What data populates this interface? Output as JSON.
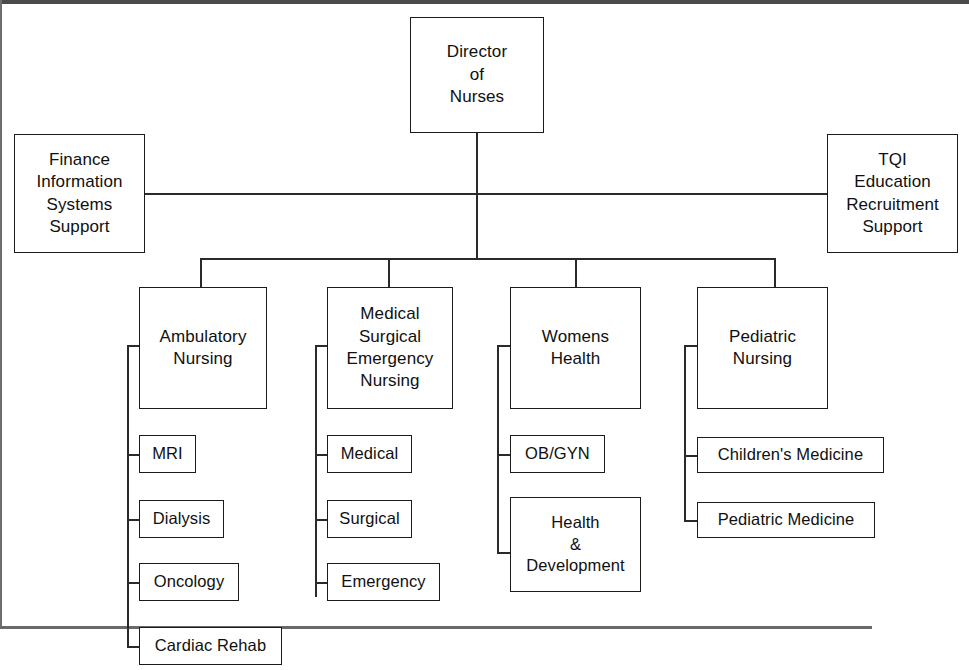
{
  "chart": {
    "type": "organizational-chart",
    "line_color": "#2a2a2a",
    "box_border_color": "#1b1b1b",
    "background_color": "#ffffff"
  },
  "root": {
    "label": "Director\nof\nNurses"
  },
  "staff": {
    "left": {
      "label": "Finance\nInformation\nSystems\nSupport"
    },
    "right": {
      "label": "TQI\nEducation\nRecruitment\nSupport"
    }
  },
  "departments": [
    {
      "label": "Ambulatory\nNursing",
      "children": [
        {
          "label": "MRI"
        },
        {
          "label": "Dialysis"
        },
        {
          "label": "Oncology"
        },
        {
          "label": "Cardiac Rehab"
        }
      ]
    },
    {
      "label": "Medical\nSurgical\nEmergency\nNursing",
      "children": [
        {
          "label": "Medical"
        },
        {
          "label": "Surgical"
        },
        {
          "label": "Emergency"
        }
      ]
    },
    {
      "label": "Womens\nHealth",
      "children": [
        {
          "label": "OB/GYN"
        },
        {
          "label": "Health\n&\nDevelopment"
        }
      ]
    },
    {
      "label": "Pediatric\nNursing",
      "children": [
        {
          "label": "Children's Medicine"
        },
        {
          "label": "Pediatric Medicine"
        }
      ]
    }
  ]
}
